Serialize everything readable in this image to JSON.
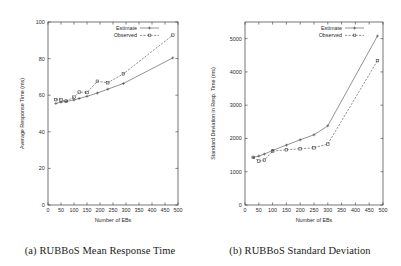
{
  "figures": [
    {
      "id": "rubbos-mean-response-time",
      "caption": "(a) RUBBoS Mean Response Time",
      "chart_data": {
        "type": "line",
        "title": "",
        "xlabel": "Number of EBs",
        "ylabel": "Average Response Time (ms)",
        "xlim": [
          0,
          500
        ],
        "ylim": [
          0,
          100
        ],
        "xticks": [
          0,
          50,
          100,
          150,
          200,
          250,
          300,
          350,
          400,
          450,
          500
        ],
        "yticks": [
          0,
          20,
          40,
          60,
          80,
          100
        ],
        "grid": false,
        "legend_position": "top-right",
        "series": [
          {
            "name": "Estimate",
            "marker": "plus",
            "style": "solid",
            "x": [
              30,
              50,
              70,
              100,
              120,
              150,
              190,
              230,
              290,
              480
            ],
            "y": [
              55.5,
              56.2,
              56.6,
              57.4,
              58.2,
              59.4,
              61.2,
              63.3,
              66.4,
              80.4
            ]
          },
          {
            "name": "Observed",
            "marker": "square",
            "style": "dashed",
            "x": [
              30,
              50,
              70,
              100,
              120,
              150,
              190,
              230,
              290,
              480
            ],
            "y": [
              57.6,
              57.4,
              56.8,
              58.9,
              61.7,
              61.5,
              67.6,
              66.8,
              71.7,
              92.8
            ]
          }
        ]
      }
    },
    {
      "id": "rubbos-standard-deviation",
      "caption": "(b) RUBBoS Standard Deviation",
      "chart_data": {
        "type": "line",
        "title": "",
        "xlabel": "Number of EBs",
        "ylabel": "Standard Deviation in Resp. Time (ms)",
        "xlim": [
          0,
          500
        ],
        "ylim": [
          0,
          5500
        ],
        "xticks": [
          0,
          50,
          100,
          150,
          200,
          250,
          300,
          350,
          400,
          450,
          500
        ],
        "yticks": [
          0,
          1000,
          2000,
          3000,
          4000,
          5000
        ],
        "grid": false,
        "legend_position": "top-right",
        "series": [
          {
            "name": "Estimate",
            "marker": "plus",
            "style": "solid",
            "x": [
              30,
              50,
              70,
              100,
              150,
              200,
              250,
              300,
              480
            ],
            "y": [
              1430,
              1470,
              1530,
              1640,
              1800,
              1960,
              2110,
              2380,
              5080
            ]
          },
          {
            "name": "Observed",
            "marker": "square",
            "style": "dashed",
            "x": [
              30,
              50,
              70,
              100,
              150,
              200,
              250,
              300,
              480
            ],
            "y": [
              1430,
              1320,
              1350,
              1620,
              1660,
              1690,
              1720,
              1830,
              4340
            ]
          }
        ]
      }
    }
  ]
}
